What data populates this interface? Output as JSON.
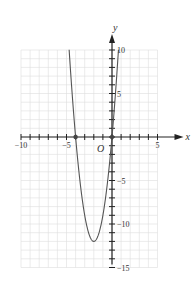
{
  "chart_data": {
    "type": "line",
    "title": "",
    "xlabel": "x",
    "ylabel": "y",
    "origin_label": "O",
    "function": "y = 3x^2 + 12x",
    "xlim": [
      -10,
      5
    ],
    "ylim": [
      -15,
      10
    ],
    "grid": true,
    "x_tick_labels": [
      "-10",
      "-5",
      "5"
    ],
    "y_tick_labels": [
      "10",
      "5",
      "-5",
      "-10",
      "-15"
    ],
    "key_points": [
      {
        "x": -4,
        "y": 0,
        "label": "x-intercept"
      },
      {
        "x": 0,
        "y": 0,
        "label": "x-intercept"
      },
      {
        "x": -2,
        "y": -12,
        "label": "vertex"
      }
    ],
    "series": [
      {
        "name": "parabola",
        "x": [
          -4.71,
          -4.5,
          -4,
          -3.5,
          -3,
          -2.5,
          -2,
          -1.5,
          -1,
          -0.5,
          0,
          0.5,
          0.71
        ],
        "values": [
          10,
          6.75,
          0,
          -5.25,
          -9,
          -11.25,
          -12,
          -11.25,
          -9,
          -5.25,
          0,
          6.75,
          10
        ]
      }
    ],
    "colors": {
      "curve": "#555555",
      "axis": "#222222",
      "grid": "#dddddd"
    }
  }
}
